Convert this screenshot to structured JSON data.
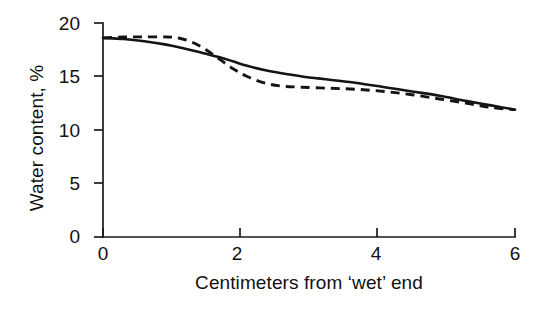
{
  "chart_data": {
    "type": "line",
    "title": "",
    "xlabel": "Centimeters from ‘wet’ end",
    "ylabel": "Water content, %",
    "xlim": [
      0,
      6
    ],
    "ylim": [
      0,
      20
    ],
    "xticks": [
      0,
      2,
      4,
      6
    ],
    "xtick_labels": [
      "0",
      "2",
      "4",
      "6"
    ],
    "yticks": [
      0,
      5,
      10,
      15,
      20
    ],
    "ytick_labels": [
      "0",
      "5",
      "10",
      "15",
      "20"
    ],
    "grid": false,
    "legend": false,
    "legend_position": "none",
    "series": [
      {
        "name": "solid curve",
        "style": "solid",
        "color": "#141414",
        "x": [
          0.0,
          0.3,
          0.6,
          0.9,
          1.2,
          1.45,
          1.7,
          1.9,
          2.1,
          2.35,
          2.6,
          2.9,
          3.3,
          3.7,
          4.1,
          4.5,
          4.9,
          5.3,
          5.65,
          6.0
        ],
        "y": [
          18.6,
          18.5,
          18.3,
          18.0,
          17.6,
          17.2,
          16.8,
          16.4,
          16.0,
          15.6,
          15.3,
          15.0,
          14.7,
          14.4,
          14.0,
          13.6,
          13.2,
          12.7,
          12.3,
          11.9
        ]
      },
      {
        "name": "dashed curve",
        "style": "dashed",
        "color": "#141414",
        "x": [
          0.0,
          0.3,
          0.6,
          0.9,
          1.1,
          1.3,
          1.5,
          1.7,
          1.9,
          2.1,
          2.35,
          2.6,
          2.9,
          3.3,
          3.7,
          4.1,
          4.5,
          4.9,
          5.3,
          5.65,
          6.0
        ],
        "y": [
          18.6,
          18.7,
          18.7,
          18.7,
          18.6,
          18.2,
          17.5,
          16.6,
          15.7,
          15.0,
          14.4,
          14.1,
          14.0,
          13.9,
          13.8,
          13.6,
          13.3,
          12.9,
          12.5,
          12.1,
          11.9
        ]
      }
    ],
    "annotations": []
  },
  "axis": {
    "y_title": "Water content, %",
    "x_title": "Centimeters from ‘wet’ end"
  }
}
